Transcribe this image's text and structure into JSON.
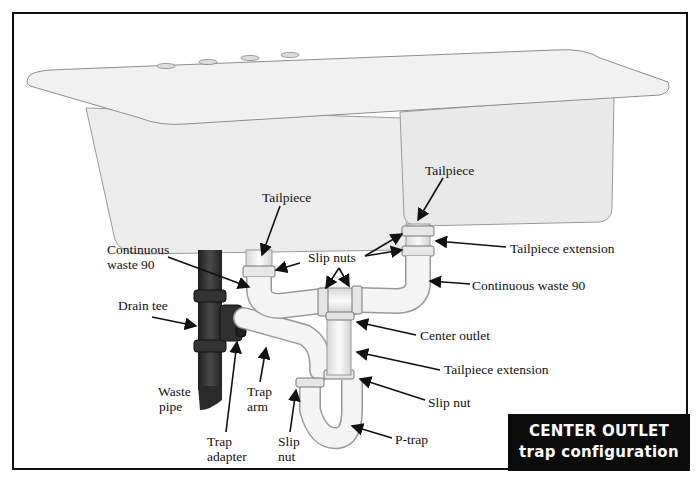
{
  "title": {
    "line1": "CENTER OUTLET",
    "line2": "trap configuration"
  },
  "labels": {
    "tailpiece_left": "Tailpiece",
    "tailpiece_right": "Tailpiece",
    "continuous_waste_left_1": "Continuous",
    "continuous_waste_left_2": "waste 90",
    "slip_nuts": "Slip nuts",
    "tailpiece_extension_top": "Tailpiece extension",
    "continuous_waste_right": "Continuous waste 90",
    "drain_tee": "Drain tee",
    "center_outlet": "Center outlet",
    "tailpiece_extension_mid": "Tailpiece extension",
    "slip_nut_right": "Slip nut",
    "waste_pipe_1": "Waste",
    "waste_pipe_2": "pipe",
    "trap_arm_1": "Trap",
    "trap_arm_2": "arm",
    "trap_adapter_1": "Trap",
    "trap_adapter_2": "adapter",
    "slip_nut_left_1": "Slip",
    "slip_nut_left_2": "nut",
    "p_trap": "P-trap"
  },
  "colors": {
    "frame": "#111111",
    "sink": "#ececec",
    "pvc": "#f2f2f2",
    "drain_pipe": "#2e2e2e",
    "title_bg": "#0b0b0b",
    "title_text": "#ffffff"
  }
}
